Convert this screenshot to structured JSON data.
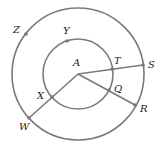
{
  "diagram": {
    "type": "concentric-circles",
    "colors": {
      "stroke": "#7a7a7a",
      "label": "#222222",
      "background": "#ffffff"
    },
    "center": {
      "name": "A",
      "x": 78,
      "y": 74
    },
    "circles": [
      {
        "name": "inner-circle",
        "r": 35
      },
      {
        "name": "outer-circle",
        "r": 66
      }
    ],
    "points": [
      {
        "name": "Z",
        "x": 26,
        "y": 34,
        "label_x": 13,
        "label_y": 25
      },
      {
        "name": "Y",
        "x": 67,
        "y": 41,
        "label_x": 63,
        "label_y": 26
      },
      {
        "name": "A",
        "x": 78,
        "y": 74,
        "label_x": 73,
        "label_y": 58
      },
      {
        "name": "T",
        "x": 112,
        "y": 69,
        "label_x": 114,
        "label_y": 56
      },
      {
        "name": "S",
        "x": 143,
        "y": 65,
        "label_x": 148,
        "label_y": 60
      },
      {
        "name": "Q",
        "x": 109,
        "y": 90,
        "label_x": 114,
        "label_y": 84
      },
      {
        "name": "R",
        "x": 135,
        "y": 105,
        "label_x": 140,
        "label_y": 104
      },
      {
        "name": "X",
        "x": 52,
        "y": 97,
        "label_x": 37,
        "label_y": 91
      },
      {
        "name": "W",
        "x": 29,
        "y": 118,
        "label_x": 19,
        "label_y": 122
      }
    ],
    "segments": [
      {
        "from": "A",
        "to": "S"
      },
      {
        "from": "A",
        "to": "R"
      },
      {
        "from": "A",
        "to": "W"
      }
    ],
    "labels": {
      "Z": "Z",
      "Y": "Y",
      "A": "A",
      "T": "T",
      "S": "S",
      "Q": "Q",
      "R": "R",
      "X": "X",
      "W": "W"
    }
  }
}
